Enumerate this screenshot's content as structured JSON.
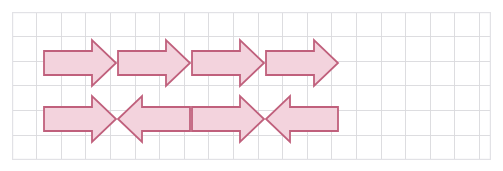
{
  "canvas": {
    "width": 503,
    "height": 171,
    "background": "#ffffff"
  },
  "grid": {
    "name": "graph-paper-grid",
    "left": 12,
    "top": 12,
    "width": 479,
    "height": 148,
    "cell_size": 24.6,
    "columns": 19,
    "rows": 6,
    "line_color": "#d9d9dd",
    "border_color": "#e2e2e6",
    "line_width": 0.9,
    "border_width": 1.2
  },
  "shapes": {
    "style": {
      "fill": "#f3d3dd",
      "stroke": "#c0607c",
      "stroke_width": 1.8
    },
    "geometry": {
      "body_height": 24,
      "head_height": 46,
      "head_length": 24,
      "note": "coordinates are relative to the grid panel origin"
    },
    "arrows": [
      {
        "id": "arrow-r1c1",
        "row": 1,
        "column": 1,
        "direction": "right",
        "label": "right-arrow",
        "x": 32,
        "y": 28,
        "length": 72
      },
      {
        "id": "arrow-r1c2",
        "row": 1,
        "column": 2,
        "direction": "right",
        "label": "right-arrow",
        "x": 106,
        "y": 28,
        "length": 72
      },
      {
        "id": "arrow-r1c3",
        "row": 1,
        "column": 3,
        "direction": "right",
        "label": "right-arrow",
        "x": 180,
        "y": 28,
        "length": 72
      },
      {
        "id": "arrow-r1c4",
        "row": 1,
        "column": 4,
        "direction": "right",
        "label": "right-arrow",
        "x": 254,
        "y": 28,
        "length": 72
      },
      {
        "id": "arrow-r2c1",
        "row": 2,
        "column": 1,
        "direction": "right",
        "label": "right-arrow",
        "x": 32,
        "y": 84,
        "length": 72
      },
      {
        "id": "arrow-r2c2",
        "row": 2,
        "column": 2,
        "direction": "left",
        "label": "left-arrow",
        "x": 106,
        "y": 84,
        "length": 72
      },
      {
        "id": "arrow-r2c3",
        "row": 2,
        "column": 3,
        "direction": "right",
        "label": "right-arrow",
        "x": 180,
        "y": 84,
        "length": 72
      },
      {
        "id": "arrow-r2c4",
        "row": 2,
        "column": 4,
        "direction": "left",
        "label": "left-arrow",
        "x": 254,
        "y": 84,
        "length": 72
      }
    ]
  }
}
